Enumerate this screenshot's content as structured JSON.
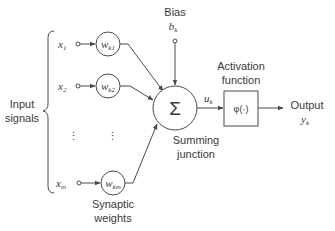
{
  "diagram": {
    "type": "neuron-model",
    "inputs": {
      "group_label_line1": "Input",
      "group_label_line2": "signals",
      "items": [
        {
          "symbol": "x",
          "sub": "1",
          "weight": "w",
          "weight_sub": "k1"
        },
        {
          "symbol": "x",
          "sub": "2",
          "weight": "w",
          "weight_sub": "k2"
        },
        {
          "symbol": "x",
          "sub": "m",
          "weight": "w",
          "weight_sub": "km"
        }
      ],
      "ellipsis": "⋮"
    },
    "weights_label_line1": "Synaptic",
    "weights_label_line2": "weights",
    "bias": {
      "label": "Bias",
      "symbol": "b",
      "sub": "k"
    },
    "summing": {
      "symbol": "Σ",
      "label_line1": "Summing",
      "label_line2": "junction"
    },
    "induced_field": {
      "symbol": "u",
      "sub": "k"
    },
    "activation": {
      "label_line1": "Activation",
      "label_line2": "function",
      "symbol": "φ(·)"
    },
    "output": {
      "label": "Output",
      "symbol": "y",
      "sub": "k"
    },
    "colors": {
      "stroke": "#4a4a4a",
      "text": "#3a3a3a",
      "background": "#ffffff"
    }
  }
}
